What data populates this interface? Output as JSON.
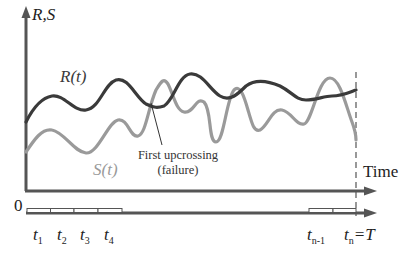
{
  "diagram": {
    "y_axis_label": "R,S",
    "x_axis_label": "Time",
    "origin_label": "0",
    "curves": [
      {
        "name": "R(t)",
        "label_main": "R",
        "label_arg": "(t)",
        "color": "#3a3a3a",
        "role": "resistance"
      },
      {
        "name": "S(t)",
        "label_main": "S",
        "label_arg": "(t)",
        "color": "#9a9a9a",
        "role": "load effect"
      }
    ],
    "annotation": {
      "line1": "First upcrossing",
      "line2": "(failure)"
    },
    "time_ticks": [
      {
        "base": "t",
        "sub": "1"
      },
      {
        "base": "t",
        "sub": "2"
      },
      {
        "base": "t",
        "sub": "3"
      },
      {
        "base": "t",
        "sub": "4"
      },
      {
        "base": "t",
        "sub": "n-1"
      },
      {
        "base": "t",
        "sub": "n",
        "suffix": "=T"
      }
    ],
    "colors": {
      "axis": "#555555",
      "r_curve": "#3a3a3a",
      "s_curve": "#9a9a9a",
      "dashed_line": "#555555"
    }
  }
}
